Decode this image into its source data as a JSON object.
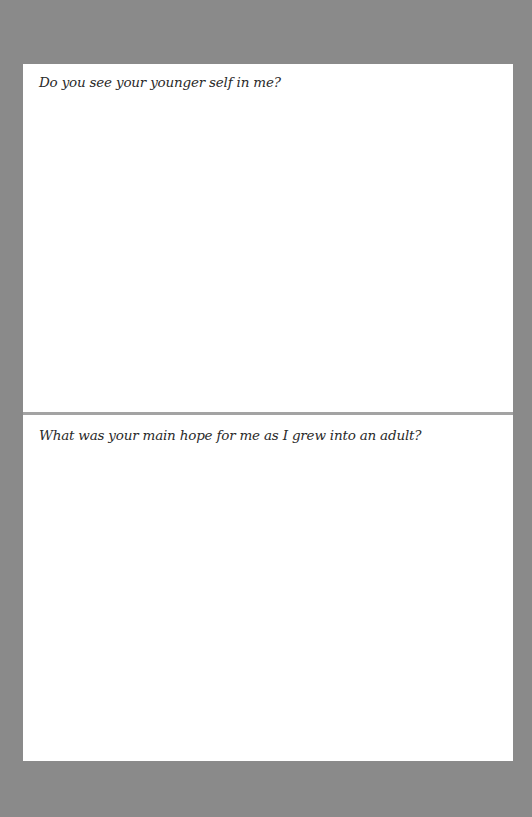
{
  "page": {
    "sections": [
      {
        "prompt": "Do you see your younger self in me?"
      },
      {
        "prompt": "What was your main hope for me as I grew into an adult?"
      }
    ]
  },
  "colors": {
    "background": "#8a8a8a",
    "page": "#ffffff",
    "divider": "#a3a3a3",
    "text": "#2a2a2a"
  }
}
